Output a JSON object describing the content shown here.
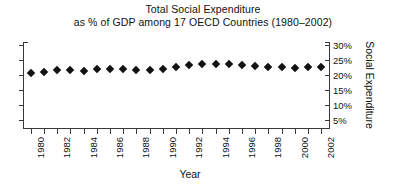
{
  "chart_data": {
    "type": "scatter",
    "title": "Total Social Expenditure as % of GDP among 17 OECD Countries (1980–2002)",
    "title_lines": [
      "Total Social Expenditure",
      "as % of GDP among 17 OECD Countries (1980–2002)"
    ],
    "xlabel": "Year",
    "ylabel": "Social Expenditure",
    "xlim": [
      1979.4,
      2002.6
    ],
    "ylim": [
      2.5,
      31.0
    ],
    "grid": false,
    "legend": false,
    "marker": "diamond",
    "marker_color": "#121212",
    "ytick_values": [
      30,
      25,
      20,
      15,
      10,
      5
    ],
    "ytick_labels": [
      "30%",
      "25%",
      "20%",
      "15%",
      "10%",
      "5%"
    ],
    "xtick_values": [
      1980,
      1981,
      1982,
      1983,
      1984,
      1985,
      1986,
      1987,
      1988,
      1989,
      1990,
      1991,
      1992,
      1993,
      1994,
      1995,
      1996,
      1997,
      1998,
      1999,
      2000,
      2001,
      2002
    ],
    "xtick_labeled": [
      1980,
      1982,
      1984,
      1986,
      1988,
      1990,
      1992,
      1994,
      1996,
      1998,
      2000,
      2002
    ],
    "x": [
      1980,
      1981,
      1982,
      1983,
      1984,
      1985,
      1986,
      1987,
      1988,
      1989,
      1990,
      1991,
      1992,
      1993,
      1994,
      1995,
      1996,
      1997,
      1998,
      1999,
      2000,
      2001,
      2002
    ],
    "values": [
      20.6,
      21.2,
      21.6,
      21.7,
      21.5,
      21.9,
      21.9,
      21.9,
      21.8,
      21.7,
      22.1,
      22.6,
      23.3,
      23.7,
      23.8,
      23.7,
      23.4,
      23.1,
      22.8,
      22.6,
      22.4,
      22.6,
      22.6
    ],
    "value_unit": "%"
  }
}
